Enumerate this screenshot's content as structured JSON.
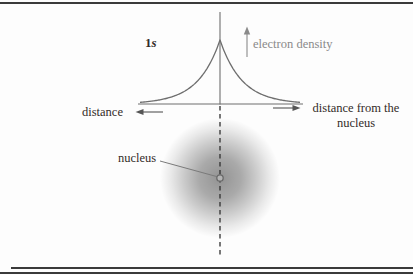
{
  "figure": {
    "orbital_label": {
      "number": "1",
      "letter": "s"
    },
    "y_axis_label": "electron density",
    "x_axis_left_label": "distance",
    "x_axis_right_label_line1": "distance from the",
    "x_axis_right_label_line2": "nucleus",
    "nucleus_label": "nucleus",
    "colors": {
      "curve_gray": "#6e6e6e",
      "gray_label": "#8a8a8a",
      "text": "#332b28",
      "dashed_line": "#303030",
      "rule": "#3a3a3a",
      "cloud_center_gray": "#8f8f8f",
      "nucleus_dot_fill": "#b4b4b4",
      "nucleus_dot_stroke": "#696969"
    },
    "curve": {
      "type": "exponential-peak",
      "center_x": 220,
      "peak_y": 40,
      "base_y": 104,
      "decay": 22,
      "x_start": 140,
      "x_end": 300
    }
  }
}
